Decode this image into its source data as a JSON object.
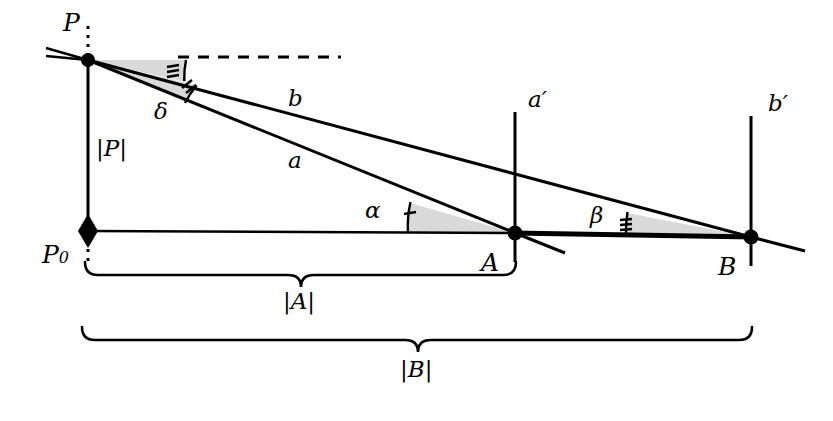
{
  "figure": {
    "type": "geometry-diagram",
    "title": ""
  },
  "labels": {
    "P": "P",
    "P0_main": "P",
    "P0_sub": "0",
    "A": "A",
    "B": "B",
    "a": "a",
    "b": "b",
    "a_prime": "a′",
    "b_prime": "b′",
    "alpha": "α",
    "beta": "β",
    "delta": "δ",
    "abs_P": "|P|",
    "abs_A": "|A|",
    "abs_B": "|B|"
  },
  "points": {
    "P": {
      "x": 88,
      "y": 60,
      "marker": "dot"
    },
    "P0": {
      "x": 88,
      "y": 230,
      "marker": "diamond"
    },
    "A": {
      "x": 515,
      "y": 233,
      "marker": "dot"
    },
    "B": {
      "x": 751,
      "y": 237,
      "marker": "dot"
    }
  },
  "angles": {
    "alpha": {
      "vertex": "A",
      "ticks": 1,
      "shaded": true
    },
    "beta": {
      "vertex": "B",
      "ticks": 3,
      "shaded": true
    },
    "delta": {
      "vertex": "P",
      "ticks": 2,
      "shaded": true
    },
    "delta_outer": {
      "vertex": "P",
      "ticks": 3,
      "shaded": true
    }
  },
  "braces": {
    "abs_A": {
      "from_x": 85,
      "to_x": 516,
      "y": 262,
      "label": "|A|"
    },
    "abs_B": {
      "from_x": 82,
      "to_x": 752,
      "y": 327,
      "label": "|B|"
    }
  },
  "colors": {
    "stroke": "#000000",
    "shade": "#d9d9d9",
    "background": "#ffffff"
  }
}
